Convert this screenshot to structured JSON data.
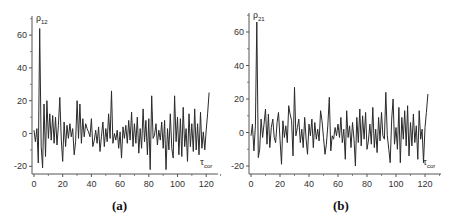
{
  "chart_data": [
    {
      "type": "line",
      "panel_label": "(a)",
      "title": "",
      "xlabel": "τ_cor",
      "ylabel": "ρ_12",
      "x_ticks": [
        0,
        20,
        40,
        60,
        80,
        100,
        120
      ],
      "y_ticks": [
        -20,
        0,
        20,
        40,
        60
      ],
      "xlim": [
        0,
        130
      ],
      "ylim": [
        -25,
        70
      ],
      "grid": false,
      "legend": null,
      "series": [
        {
          "name": "ρ12",
          "x": [
            0,
            1,
            2,
            3,
            4,
            5,
            6,
            7,
            8,
            9,
            10,
            11,
            12,
            13,
            14,
            15,
            16,
            17,
            18,
            19,
            20,
            21,
            22,
            23,
            24,
            25,
            26,
            27,
            28,
            29,
            30,
            31,
            32,
            33,
            34,
            35,
            36,
            37,
            38,
            39,
            40,
            41,
            42,
            43,
            44,
            45,
            46,
            47,
            48,
            49,
            50,
            51,
            52,
            53,
            54,
            55,
            56,
            57,
            58,
            59,
            60,
            61,
            62,
            63,
            64,
            65,
            66,
            67,
            68,
            69,
            70,
            71,
            72,
            73,
            74,
            75,
            76,
            77,
            78,
            79,
            80,
            81,
            82,
            83,
            84,
            85,
            86,
            87,
            88,
            89,
            90,
            91,
            92,
            93,
            94,
            95,
            96,
            97,
            98,
            99,
            100,
            101,
            102,
            103,
            104,
            105,
            106,
            107,
            108,
            109,
            110,
            111,
            112,
            113,
            114,
            115,
            116,
            117,
            118,
            119,
            120,
            121,
            122
          ],
          "values": [
            2,
            -5,
            3,
            -18,
            64,
            -8,
            -21,
            18,
            -14,
            20,
            -3,
            12,
            -4,
            11,
            -6,
            10,
            -7,
            5,
            22,
            -4,
            -17,
            7,
            -8,
            5,
            -3,
            6,
            -2,
            3,
            -13,
            -5,
            20,
            -3,
            18,
            -6,
            9,
            -2,
            6,
            3,
            1,
            -2,
            9,
            -8,
            -4,
            2,
            -6,
            4,
            -11,
            -2,
            7,
            -8,
            3,
            -5,
            12,
            -3,
            26,
            -6,
            0,
            -4,
            2,
            -9,
            1,
            -15,
            4,
            -3,
            5,
            -6,
            8,
            -4,
            13,
            -8,
            6,
            -6,
            10,
            -12,
            3,
            -9,
            15,
            -5,
            8,
            -13,
            9,
            -22,
            23,
            -3,
            -1,
            6,
            -7,
            2,
            -4,
            7,
            -9,
            8,
            -22,
            3,
            -10,
            12,
            -9,
            -15,
            23,
            -5,
            10,
            -13,
            9,
            -14,
            16,
            -8,
            3,
            -17,
            12,
            -8,
            6,
            -11,
            15,
            -10,
            6,
            -13,
            13,
            -9,
            1,
            -10,
            2,
            12,
            25
          ]
        }
      ]
    },
    {
      "type": "line",
      "panel_label": "(b)",
      "title": "",
      "xlabel": "τ_cor",
      "ylabel": "ρ_21",
      "x_ticks": [
        0,
        20,
        40,
        60,
        80,
        100,
        120
      ],
      "y_ticks": [
        -20,
        0,
        20,
        40,
        60
      ],
      "xlim": [
        0,
        130
      ],
      "ylim": [
        -25,
        70
      ],
      "grid": false,
      "legend": null,
      "series": [
        {
          "name": "ρ21",
          "x": [
            0,
            1,
            2,
            3,
            4,
            5,
            6,
            7,
            8,
            9,
            10,
            11,
            12,
            13,
            14,
            15,
            16,
            17,
            18,
            19,
            20,
            21,
            22,
            23,
            24,
            25,
            26,
            27,
            28,
            29,
            30,
            31,
            32,
            33,
            34,
            35,
            36,
            37,
            38,
            39,
            40,
            41,
            42,
            43,
            44,
            45,
            46,
            47,
            48,
            49,
            50,
            51,
            52,
            53,
            54,
            55,
            56,
            57,
            58,
            59,
            60,
            61,
            62,
            63,
            64,
            65,
            66,
            67,
            68,
            69,
            70,
            71,
            72,
            73,
            74,
            75,
            76,
            77,
            78,
            79,
            80,
            81,
            82,
            83,
            84,
            85,
            86,
            87,
            88,
            89,
            90,
            91,
            92,
            93,
            94,
            95,
            96,
            97,
            98,
            99,
            100,
            101,
            102,
            103,
            104,
            105,
            106,
            107,
            108,
            109,
            110,
            111,
            112,
            113,
            114,
            115,
            116,
            117,
            118,
            119,
            120,
            121,
            122
          ],
          "values": [
            -2,
            5,
            -11,
            4,
            66,
            -15,
            -10,
            8,
            -3,
            5,
            14,
            -7,
            11,
            -9,
            3,
            8,
            -3,
            -6,
            6,
            12,
            -4,
            -19,
            7,
            -3,
            4,
            -6,
            16,
            11,
            7,
            -14,
            27,
            -2,
            3,
            8,
            -6,
            2,
            -9,
            9,
            -4,
            -13,
            5,
            -2,
            8,
            -9,
            6,
            -4,
            2,
            -5,
            13,
            7,
            -3,
            -13,
            -7,
            4,
            21,
            -11,
            -2,
            -4,
            3,
            -2,
            5,
            -3,
            9,
            -6,
            2,
            -16,
            13,
            -3,
            4,
            -9,
            6,
            -4,
            -20,
            9,
            -6,
            14,
            -8,
            10,
            -4,
            12,
            -10,
            -5,
            5,
            -7,
            15,
            -9,
            2,
            -12,
            9,
            -5,
            12,
            -2,
            -4,
            24,
            -2,
            -10,
            -18,
            8,
            20,
            -7,
            3,
            -10,
            15,
            -18,
            9,
            -4,
            13,
            -8,
            16,
            -14,
            6,
            -8,
            11,
            -6,
            4,
            -16,
            13,
            -4,
            2,
            -18,
            3,
            12,
            23
          ]
        }
      ]
    }
  ],
  "panels": [
    {
      "caption": "(a)",
      "ylabel_main": "ρ",
      "ylabel_sub": "12",
      "xlabel_main": "τ",
      "xlabel_sub": "cor",
      "x_tick_labels": [
        "0",
        "20",
        "40",
        "60",
        "80",
        "100",
        "120"
      ],
      "y_tick_labels": [
        "-20",
        "0",
        "20",
        "40",
        "60"
      ]
    },
    {
      "caption": "(b)",
      "ylabel_main": "ρ",
      "ylabel_sub": "21",
      "xlabel_main": "τ",
      "xlabel_sub": "cor",
      "x_tick_labels": [
        "0",
        "20",
        "40",
        "60",
        "80",
        "100",
        "120"
      ],
      "y_tick_labels": [
        "-20",
        "0",
        "20",
        "40",
        "60"
      ]
    }
  ],
  "colors": {
    "line": "#2a2a2a",
    "axis": "#555555"
  }
}
